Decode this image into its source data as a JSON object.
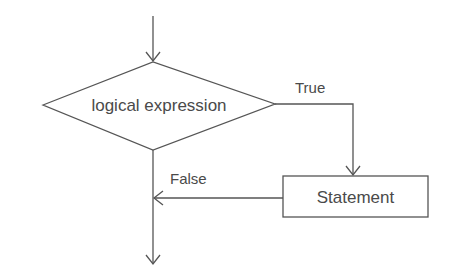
{
  "diagram": {
    "type": "flowchart",
    "colors": {
      "line": "#555555",
      "text": "#4a4a4a",
      "background": "#ffffff"
    },
    "nodes": {
      "decision": {
        "shape": "diamond",
        "label": "logical expression"
      },
      "statement": {
        "shape": "rectangle",
        "label": "Statement"
      }
    },
    "edges": {
      "entry": {
        "from": "start",
        "to": "decision",
        "label": ""
      },
      "true_branch": {
        "from": "decision",
        "to": "statement",
        "label": "True"
      },
      "false_branch": {
        "from": "statement",
        "to": "merge",
        "label": "False"
      },
      "exit": {
        "from": "decision",
        "to": "end",
        "label": ""
      }
    }
  }
}
